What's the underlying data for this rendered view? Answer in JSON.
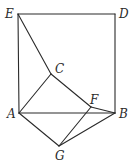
{
  "diagram": {
    "type": "geometry",
    "points": {
      "E": {
        "label": "E",
        "x": 18,
        "y": 14
      },
      "D": {
        "label": "D",
        "x": 115,
        "y": 14
      },
      "C": {
        "label": "C",
        "x": 51,
        "y": 74
      },
      "A": {
        "label": "A",
        "x": 19,
        "y": 113
      },
      "B": {
        "label": "B",
        "x": 115,
        "y": 113
      },
      "F": {
        "label": "F",
        "x": 91,
        "y": 107
      },
      "G": {
        "label": "G",
        "x": 59,
        "y": 146
      }
    },
    "segments": [
      [
        "E",
        "D"
      ],
      [
        "D",
        "B"
      ],
      [
        "E",
        "A"
      ],
      [
        "A",
        "B"
      ],
      [
        "E",
        "C"
      ],
      [
        "C",
        "F"
      ],
      [
        "F",
        "B"
      ],
      [
        "A",
        "C"
      ],
      [
        "A",
        "G"
      ],
      [
        "G",
        "B"
      ],
      [
        "G",
        "F"
      ]
    ],
    "labels": {
      "E": "E",
      "D": "D",
      "C": "C",
      "A": "A",
      "B": "B",
      "F": "F",
      "G": "G"
    }
  }
}
